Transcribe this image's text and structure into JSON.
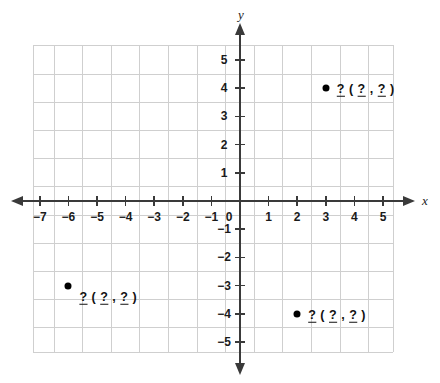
{
  "figure": {
    "kind": "coordinate-plane",
    "axis_labels": {
      "x": "x",
      "y": "y"
    }
  },
  "axes": {
    "x_ticks": [
      {
        "value": -7,
        "label": "−7"
      },
      {
        "value": -6,
        "label": "−6"
      },
      {
        "value": -5,
        "label": "−5"
      },
      {
        "value": -4,
        "label": "−4"
      },
      {
        "value": -3,
        "label": "−3"
      },
      {
        "value": -2,
        "label": "−2"
      },
      {
        "value": -1,
        "label": "−1"
      },
      {
        "value": 1,
        "label": "1"
      },
      {
        "value": 2,
        "label": "2"
      },
      {
        "value": 3,
        "label": "3"
      },
      {
        "value": 4,
        "label": "4"
      },
      {
        "value": 5,
        "label": "5"
      }
    ],
    "y_ticks": [
      {
        "value": 5,
        "label": "5"
      },
      {
        "value": 4,
        "label": "4"
      },
      {
        "value": 3,
        "label": "3"
      },
      {
        "value": 2,
        "label": "2"
      },
      {
        "value": 1,
        "label": "1"
      },
      {
        "value": -1,
        "label": "−1"
      },
      {
        "value": -2,
        "label": "−2"
      },
      {
        "value": -3,
        "label": "−3"
      },
      {
        "value": -4,
        "label": "−4"
      },
      {
        "value": -5,
        "label": "−5"
      }
    ],
    "origin_label": "0"
  },
  "points": [
    {
      "name": "point-a",
      "x": 3,
      "y": 4,
      "label": {
        "name_blank": "?",
        "open": "(",
        "x_blank": "?",
        "comma": ",",
        "y_blank": "?",
        "close": ")"
      }
    },
    {
      "name": "point-b",
      "x": -6,
      "y": -3,
      "label": {
        "name_blank": "?",
        "open": "(",
        "x_blank": "?",
        "comma": ",",
        "y_blank": "?",
        "close": ")"
      }
    },
    {
      "name": "point-c",
      "x": 2,
      "y": -4,
      "label": {
        "name_blank": "?",
        "open": "(",
        "x_blank": "?",
        "comma": ",",
        "y_blank": "?",
        "close": ")"
      }
    }
  ],
  "chart_data": {
    "type": "scatter",
    "title": "",
    "xlabel": "x",
    "ylabel": "y",
    "xlim": [
      -7.4,
      5.4
    ],
    "ylim": [
      -5.6,
      5.6
    ],
    "grid": true,
    "legend": null,
    "x_tick_values": [
      -7,
      -6,
      -5,
      -4,
      -3,
      -2,
      -1,
      0,
      1,
      2,
      3,
      4,
      5
    ],
    "y_tick_values": [
      -5,
      -4,
      -3,
      -2,
      -1,
      0,
      1,
      2,
      3,
      4,
      5
    ],
    "series": [
      {
        "name": "plotted points",
        "points": [
          {
            "x": 3,
            "y": 4,
            "annotation": "? ( ? , ? )"
          },
          {
            "x": -6,
            "y": -3,
            "annotation": "? ( ? , ? )"
          },
          {
            "x": 2,
            "y": -4,
            "annotation": "? ( ? , ? )"
          }
        ]
      }
    ]
  },
  "style": {
    "grid_color": "#cfcfcf",
    "axis_color": "#3a3a3a",
    "point_color": "#000000",
    "text_color": "#1a1a1a",
    "background": "#ffffff"
  }
}
